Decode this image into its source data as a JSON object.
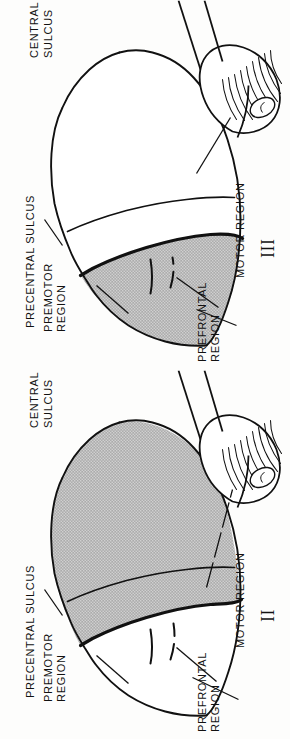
{
  "figure": {
    "type": "anatomical-diagram",
    "orientation": "labels rotated 90 degrees (page is sideways)",
    "background_color": "#fdfdfc",
    "ink_color": "#111111",
    "shading_color": "#9a9a9a",
    "shading_style": "stipple-dot-screen"
  },
  "panels": [
    {
      "id": "III",
      "numeral": "III",
      "shaded_area": "frontal: premotor and prefrontal regions",
      "labels": [
        {
          "name": "central-sulcus",
          "lines": [
            "CENTRAL",
            "SULCUS"
          ]
        },
        {
          "name": "precentral-sulcus",
          "lines": [
            "PRECENTRAL  SULCUS"
          ]
        },
        {
          "name": "premotor-region",
          "lines": [
            "PREMOTOR",
            "REGION"
          ]
        },
        {
          "name": "prefrontal-region",
          "lines": [
            "PREFRONTAL",
            "REGION"
          ]
        },
        {
          "name": "motor-region",
          "lines": [
            "MOTOR REGION"
          ]
        }
      ]
    },
    {
      "id": "II",
      "numeral": "II",
      "shaded_area": "posterior: motor region and everything caudal to precentral sulcus",
      "labels": [
        {
          "name": "central-sulcus",
          "lines": [
            "CENTRAL",
            "SULCUS"
          ]
        },
        {
          "name": "precentral-sulcus",
          "lines": [
            "PRECENTRAL  SULCUS"
          ]
        },
        {
          "name": "premotor-region",
          "lines": [
            "PREMOTOR",
            "REGION"
          ]
        },
        {
          "name": "prefrontal-region",
          "lines": [
            "PREFRONTAL",
            "REGION"
          ]
        },
        {
          "name": "motor-region",
          "lines": [
            "MOTOR REGION"
          ]
        }
      ]
    }
  ]
}
